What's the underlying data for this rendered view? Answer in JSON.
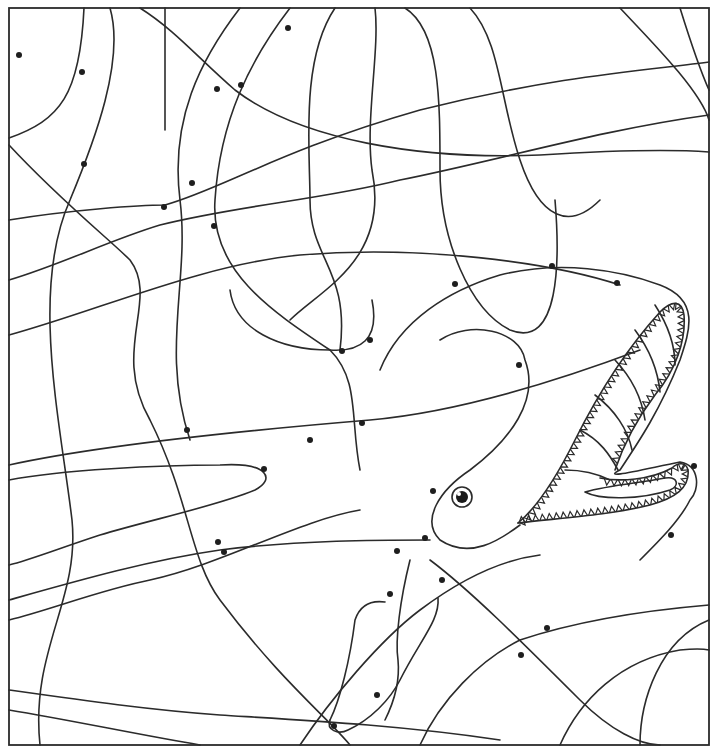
{
  "page": {
    "type": "hidden-picture-coloring-page",
    "background": "#ffffff",
    "line_color": "#2b2b2b",
    "dot_color": "#1e1e1e"
  },
  "frame": {
    "x": 9,
    "y": 8,
    "w": 700,
    "h": 737
  },
  "background_lines": [
    "M9,138 C60,120 80,95 84,8",
    "M110,8 C125,60 95,140 70,200 C30,290 60,420 72,520 C80,600 30,650 40,745",
    "M140,8 C175,30 200,60 235,90 C300,140 420,160 540,155 C620,150 680,150 709,152",
    "M165,8 L165,130",
    "M9,220 C70,210 140,205 165,205 C220,190 280,150 420,110 C560,75 650,70 709,62",
    "M9,145 C60,200 110,240 130,260 C160,300 110,350 150,420 C190,500 190,560 220,600 C280,680 330,720 350,745",
    "M9,280 C60,265 110,240 160,225 C240,205 320,200 400,180 C500,160 600,130 709,115",
    "M9,335 C100,310 200,265 300,255 C420,245 550,262 620,285",
    "M240,8 C200,60 170,120 180,200 C190,280 160,350 190,440",
    "M290,8 C250,60 220,120 215,200 C210,270 270,310 330,350 C360,380 350,420 360,470",
    "M335,8 C300,60 310,150 310,200 C310,260 350,270 340,350",
    "M375,8 C380,50 365,120 372,170 C390,260 320,290 290,320",
    "M405,8 C440,30 440,100 440,170 C440,240 470,310 510,330 C560,350 560,260 555,200",
    "M470,8 C500,40 500,100 520,160 C540,220 570,230 600,200",
    "M620,8 C650,40 700,90 709,120",
    "M680,8 C690,40 700,70 709,90",
    "M9,465 C100,445 250,430 370,420 C460,412 560,380 640,350",
    "M9,480 C60,470 160,465 220,465 C270,462 275,480 255,490 C220,505 150,520 100,535 C60,548 30,560 9,565",
    "M9,600 C80,580 150,560 220,550 C300,540 380,540 430,540",
    "M9,620 C50,610 100,590 150,580 C220,565 300,520 360,510",
    "M9,690 C80,700 150,710 220,715 C300,720 400,725 500,740",
    "M9,710 C70,720 140,735 200,745",
    "M300,745 C330,700 380,640 420,610 C460,580 500,560 540,555",
    "M420,745 C440,700 480,660 520,640 C580,620 650,610 709,605",
    "M560,745 C580,700 620,660 680,650 C700,648 709,650 709,650",
    "M640,745 C640,700 660,640 709,620",
    "M430,560 C470,590 520,640 580,700 C610,730 640,745 660,745"
  ],
  "shark_outline": [
    "M440,340 C470,320 520,330 525,360 C540,400 510,440 470,470 C440,490 420,520 440,540 C470,560 500,540 520,525",
    "M380,370 C400,320 450,290 500,275 C560,260 620,270 660,285 C700,300 690,330 680,360 C660,410 640,440 620,470 C600,480 640,470 680,462 C700,465 700,490 690,500 C680,520 660,540 640,560",
    "M410,560 C400,600 395,640 398,660 C400,680 395,700 385,720",
    "M330,720 C340,700 350,660 355,620 C360,605 370,600 385,602",
    "M330,720 C326,730 338,735 348,730 C370,720 390,700 400,680 C420,640 440,620 438,598",
    "M230,290 C235,330 280,350 330,350 C360,352 380,340 372,300"
  ],
  "mouth": {
    "upper_jaw": "M518,523 C540,505 560,470 575,440 C600,390 630,345 660,312 C672,300 682,300 684,315 C686,340 676,370 655,395 C640,415 625,440 615,470",
    "lower_jaw": "M518,523 C560,518 610,515 650,505 C675,498 690,488 688,470 C686,462 678,462 672,468 C650,480 620,482 600,478",
    "tongue": "M585,492 C610,485 640,483 665,478 C678,476 680,486 670,490 C640,500 600,500 585,492",
    "throat_ribs": [
      "M565,470 C585,470 600,475 610,480",
      "M580,430 C600,440 610,455 618,470",
      "M595,395 C615,410 628,430 632,450",
      "M615,360 C632,378 642,400 645,420",
      "M635,330 C650,350 658,372 660,392",
      "M655,305 C668,325 675,345 675,365"
    ]
  },
  "eye": {
    "cx": 462,
    "cy": 497,
    "r_outer": 10,
    "r_pupil": 6,
    "highlight": {
      "cx": 459,
      "cy": 494,
      "r": 2
    }
  },
  "dots": [
    [
      19,
      55
    ],
    [
      82,
      72
    ],
    [
      288,
      28
    ],
    [
      217,
      89
    ],
    [
      241,
      85
    ],
    [
      84,
      164
    ],
    [
      192,
      183
    ],
    [
      164,
      207
    ],
    [
      214,
      226
    ],
    [
      455,
      284
    ],
    [
      552,
      266
    ],
    [
      617,
      283
    ],
    [
      342,
      351
    ],
    [
      370,
      340
    ],
    [
      519,
      365
    ],
    [
      187,
      430
    ],
    [
      310,
      440
    ],
    [
      362,
      423
    ],
    [
      264,
      469
    ],
    [
      433,
      491
    ],
    [
      694,
      466
    ],
    [
      218,
      542
    ],
    [
      224,
      552
    ],
    [
      397,
      551
    ],
    [
      425,
      538
    ],
    [
      671,
      535
    ],
    [
      442,
      580
    ],
    [
      390,
      594
    ],
    [
      547,
      628
    ],
    [
      521,
      655
    ],
    [
      377,
      695
    ],
    [
      334,
      726
    ]
  ]
}
